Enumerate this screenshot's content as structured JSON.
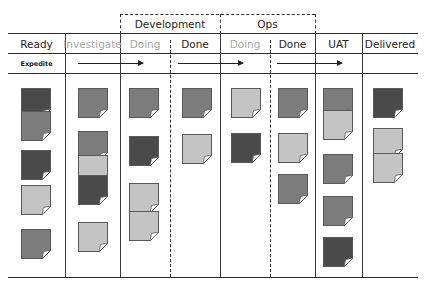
{
  "groups": [
    {
      "label": "Development",
      "left": 120,
      "right": 220
    },
    {
      "label": "Ops",
      "left": 220,
      "right": 315
    }
  ],
  "columns": [
    {
      "label": "Ready",
      "left": 8,
      "right": 65,
      "muted": false
    },
    {
      "label": "Investigate",
      "left": 65,
      "right": 120,
      "muted": true
    },
    {
      "label": "Doing",
      "left": 120,
      "right": 170,
      "muted": true
    },
    {
      "label": "Done",
      "left": 170,
      "right": 220,
      "muted": false
    },
    {
      "label": "Doing",
      "left": 220,
      "right": 270,
      "muted": true
    },
    {
      "label": "Done",
      "left": 270,
      "right": 315,
      "muted": false
    },
    {
      "label": "UAT",
      "left": 315,
      "right": 362,
      "muted": false
    },
    {
      "label": "Delivered",
      "left": 362,
      "right": 418,
      "muted": false
    }
  ],
  "expedite": {
    "label": "Expedite",
    "arrows": [
      {
        "from": 78,
        "to": 143
      },
      {
        "from": 178,
        "to": 243
      },
      {
        "from": 277,
        "to": 342
      }
    ]
  },
  "colors": {
    "dark": "#4a4a4a",
    "mid": "#7c7c7c",
    "light": "#c4c4c4",
    "line": "#2b2b2b",
    "muted_text": "#a8a8a8"
  },
  "cards": [
    {
      "column": "Ready",
      "x": 21,
      "y": 88,
      "shade": "dark"
    },
    {
      "column": "Ready",
      "x": 21,
      "y": 111,
      "shade": "mid"
    },
    {
      "column": "Ready",
      "x": 21,
      "y": 150,
      "shade": "dark"
    },
    {
      "column": "Ready",
      "x": 21,
      "y": 185,
      "shade": "light"
    },
    {
      "column": "Ready",
      "x": 21,
      "y": 229,
      "shade": "mid"
    },
    {
      "column": "Investigate",
      "x": 78,
      "y": 88,
      "shade": "mid"
    },
    {
      "column": "Investigate",
      "x": 78,
      "y": 131,
      "shade": "mid"
    },
    {
      "column": "Investigate",
      "x": 78,
      "y": 155,
      "shade": "light"
    },
    {
      "column": "Investigate",
      "x": 78,
      "y": 175,
      "shade": "dark"
    },
    {
      "column": "Investigate",
      "x": 78,
      "y": 222,
      "shade": "light"
    },
    {
      "column": "Development Doing",
      "x": 129,
      "y": 88,
      "shade": "mid"
    },
    {
      "column": "Development Doing",
      "x": 129,
      "y": 136,
      "shade": "dark"
    },
    {
      "column": "Development Doing",
      "x": 129,
      "y": 183,
      "shade": "light"
    },
    {
      "column": "Development Doing",
      "x": 129,
      "y": 211,
      "shade": "light"
    },
    {
      "column": "Development Done",
      "x": 182,
      "y": 88,
      "shade": "mid"
    },
    {
      "column": "Development Done",
      "x": 182,
      "y": 134,
      "shade": "light"
    },
    {
      "column": "Ops Doing",
      "x": 231,
      "y": 88,
      "shade": "light"
    },
    {
      "column": "Ops Doing",
      "x": 231,
      "y": 133,
      "shade": "dark"
    },
    {
      "column": "Ops Done",
      "x": 278,
      "y": 88,
      "shade": "mid"
    },
    {
      "column": "Ops Done",
      "x": 278,
      "y": 133,
      "shade": "light"
    },
    {
      "column": "Ops Done",
      "x": 278,
      "y": 174,
      "shade": "mid"
    },
    {
      "column": "UAT",
      "x": 323,
      "y": 88,
      "shade": "mid"
    },
    {
      "column": "UAT",
      "x": 323,
      "y": 110,
      "shade": "light"
    },
    {
      "column": "UAT",
      "x": 323,
      "y": 154,
      "shade": "mid"
    },
    {
      "column": "UAT",
      "x": 323,
      "y": 196,
      "shade": "mid"
    },
    {
      "column": "UAT",
      "x": 323,
      "y": 237,
      "shade": "dark"
    },
    {
      "column": "Delivered",
      "x": 373,
      "y": 88,
      "shade": "dark"
    },
    {
      "column": "Delivered",
      "x": 373,
      "y": 128,
      "shade": "light"
    },
    {
      "column": "Delivered",
      "x": 373,
      "y": 153,
      "shade": "light"
    }
  ]
}
